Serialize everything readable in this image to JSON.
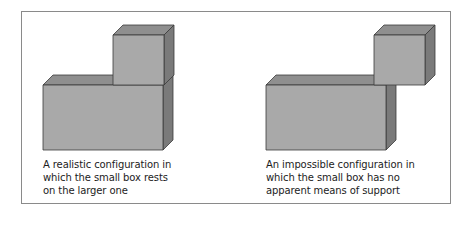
{
  "figure": {
    "panels": [
      {
        "id": "realistic",
        "caption_lines": [
          "A realistic configuration in",
          "which the small box rests",
          "on the larger one"
        ]
      },
      {
        "id": "impossible",
        "caption_lines": [
          "An impossible configuration in",
          "which the small box has no",
          "apparent means of support"
        ]
      }
    ],
    "colors": {
      "front": "#a9a9a9",
      "top": "#8f8f8f",
      "side": "#7a7a7a",
      "edge": "#3a3a3a",
      "frame": "#8a8a8a"
    }
  }
}
